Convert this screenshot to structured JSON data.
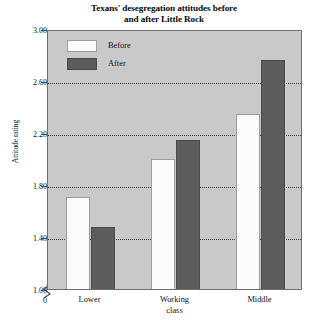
{
  "chart_data": {
    "type": "bar",
    "title": "Texans' desegregation attitudes before and after Little Rock",
    "title_lines": [
      "Texans' desegregation attitudes before",
      "and after Little Rock"
    ],
    "xlabel": "",
    "ylabel": "Attitude rating",
    "categories": [
      "Lower",
      "Working class",
      "Middle"
    ],
    "category_lines": [
      [
        "Lower"
      ],
      [
        "Working",
        "class"
      ],
      [
        "Middle"
      ]
    ],
    "series": [
      {
        "name": "Before",
        "values": [
          1.71,
          2.0,
          2.35
        ],
        "color": "#fbfbfb"
      },
      {
        "name": "After",
        "values": [
          1.48,
          2.15,
          2.76
        ],
        "color": "#5c5c5c"
      }
    ],
    "ylim": [
      1.0,
      3.0
    ],
    "yticks": [
      1.0,
      1.4,
      1.8,
      2.2,
      2.6,
      3.0
    ],
    "ytick_labels": [
      "1.00",
      "1.40",
      "1.80",
      "2.20",
      "2.60",
      "3.00"
    ],
    "y_origin_label": "0",
    "axis_break": true,
    "grid": true,
    "gridlines_at": [
      1.4,
      1.8,
      2.2,
      2.6
    ],
    "legend_position": "upper left inside plot",
    "plot_background": "#c9c9c9",
    "frame_color": "#6d6d6d"
  },
  "legend": {
    "items": [
      {
        "label": "Before",
        "swatch": "before"
      },
      {
        "label": "After",
        "swatch": "after"
      }
    ]
  },
  "axes": {
    "y_title": "Attitude rating",
    "y_origin": "0"
  }
}
